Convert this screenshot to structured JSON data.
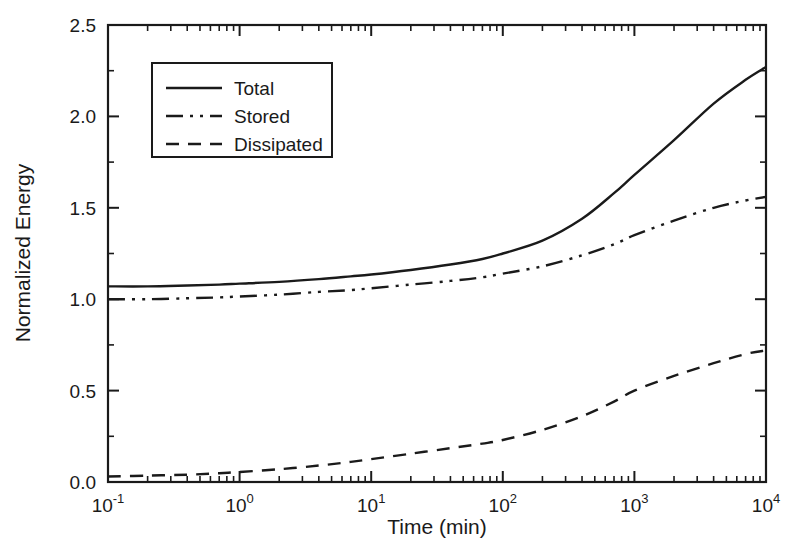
{
  "chart_data": {
    "type": "line",
    "title": "",
    "xlabel": "Time (min)",
    "ylabel": "Normalized Energy",
    "xscale": "log",
    "yscale": "linear",
    "xlim": [
      0.1,
      10000
    ],
    "ylim": [
      0.0,
      2.5
    ],
    "grid": false,
    "legend_position": "upper left",
    "xtick_labels": [
      "10⁻¹",
      "10⁰",
      "10¹",
      "10²",
      "10³",
      "10⁴"
    ],
    "xtick_values": [
      0.1,
      1,
      10,
      100,
      1000,
      10000
    ],
    "xtick_base": "10",
    "xtick_exponents": [
      "-1",
      "0",
      "1",
      "2",
      "3",
      "4"
    ],
    "ytick_labels": [
      "0.0",
      "0.5",
      "1.0",
      "1.5",
      "2.0",
      "2.5"
    ],
    "ytick_values": [
      0.0,
      0.5,
      1.0,
      1.5,
      2.0,
      2.5
    ],
    "minor_ticks": true,
    "x": [
      0.1,
      0.2,
      0.4,
      0.7,
      1,
      2,
      4,
      7,
      10,
      20,
      40,
      70,
      100,
      200,
      400,
      700,
      1000,
      2000,
      4000,
      7000,
      10000
    ],
    "series": [
      {
        "name": "Total",
        "style": "solid",
        "color": "#1a1a1a",
        "values": [
          1.07,
          1.07,
          1.075,
          1.08,
          1.085,
          1.095,
          1.11,
          1.125,
          1.135,
          1.16,
          1.19,
          1.22,
          1.25,
          1.32,
          1.44,
          1.58,
          1.68,
          1.87,
          2.07,
          2.2,
          2.27
        ]
      },
      {
        "name": "Stored",
        "style": "dash-dot-dot",
        "color": "#1a1a1a",
        "values": [
          1.0,
          1.0,
          1.005,
          1.01,
          1.015,
          1.025,
          1.04,
          1.05,
          1.06,
          1.08,
          1.1,
          1.12,
          1.14,
          1.18,
          1.24,
          1.3,
          1.35,
          1.43,
          1.5,
          1.54,
          1.56
        ]
      },
      {
        "name": "Dissipated",
        "style": "dashed",
        "color": "#1a1a1a",
        "values": [
          0.03,
          0.035,
          0.04,
          0.048,
          0.055,
          0.07,
          0.09,
          0.11,
          0.125,
          0.155,
          0.185,
          0.21,
          0.23,
          0.285,
          0.36,
          0.44,
          0.5,
          0.58,
          0.65,
          0.7,
          0.72
        ]
      }
    ]
  },
  "axes": {
    "y_title": "Normalized Energy",
    "x_title": "Time (min)"
  },
  "legend": {
    "items": [
      {
        "label": "Total",
        "style": "solid"
      },
      {
        "label": "Stored",
        "style": "dash-dot-dot"
      },
      {
        "label": "Dissipated",
        "style": "dashed"
      }
    ]
  },
  "colors": {
    "line": "#1a1a1a",
    "axis": "#1a1a1a",
    "background": "#ffffff"
  }
}
